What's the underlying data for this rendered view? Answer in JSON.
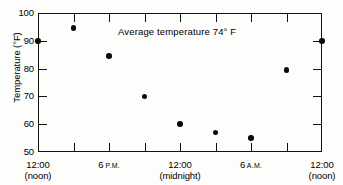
{
  "chart_data": {
    "type": "scatter",
    "title": "",
    "annotation": "Average temperature 74° F",
    "xlabel": "",
    "ylabel": "Temperature (°F)",
    "ylim": [
      50,
      100
    ],
    "xlim": [
      12,
      36
    ],
    "grid": false,
    "legend": false,
    "ytick_values": [
      50,
      60,
      70,
      80,
      90,
      100
    ],
    "ytick_labels": [
      "50",
      "60",
      "70",
      "80",
      "90",
      "100"
    ],
    "xtick_hours": [
      12,
      15,
      18,
      21,
      24,
      27,
      30,
      33,
      36
    ],
    "xtick_labels": [
      {
        "hour": 12,
        "main": "12:00",
        "small": "",
        "sub": "(noon)"
      },
      {
        "hour": 18,
        "main": "6",
        "small": "P.M.",
        "sub": ""
      },
      {
        "hour": 24,
        "main": "12:00",
        "small": "",
        "sub": "(midnight)"
      },
      {
        "hour": 30,
        "main": "6",
        "small": "A.M.",
        "sub": ""
      },
      {
        "hour": 36,
        "main": "12:00",
        "small": "",
        "sub": "(noon)"
      }
    ],
    "x": [
      12,
      15,
      18,
      21,
      24,
      27,
      30,
      33,
      36
    ],
    "values": [
      90,
      94.5,
      84.5,
      70,
      60,
      57,
      55,
      79.5,
      90
    ],
    "point_labels": [
      "12:00 noon",
      "3 P.M.",
      "6 P.M.",
      "9 P.M.",
      "12:00 midnight",
      "3 A.M.",
      "6 A.M.",
      "9 A.M.",
      "12:00 noon"
    ],
    "average_temperature": 74,
    "marker_color": "#0b0b0b",
    "axis_color": "#111111",
    "background_color": "#fdfdfc"
  }
}
